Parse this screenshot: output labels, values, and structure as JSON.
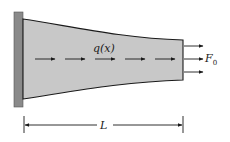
{
  "diagram": {
    "labels": {
      "distributed_load": "q(x)",
      "end_force": "F",
      "end_force_subscript": "0",
      "length": "L"
    },
    "colors": {
      "bar_fill": "#c8c8c8",
      "wall_fill": "#8a8a8a",
      "stroke": "#1a1a1a",
      "background": "#ffffff"
    },
    "distributed_arrow_count": 5,
    "end_force_arrow_count": 3
  }
}
